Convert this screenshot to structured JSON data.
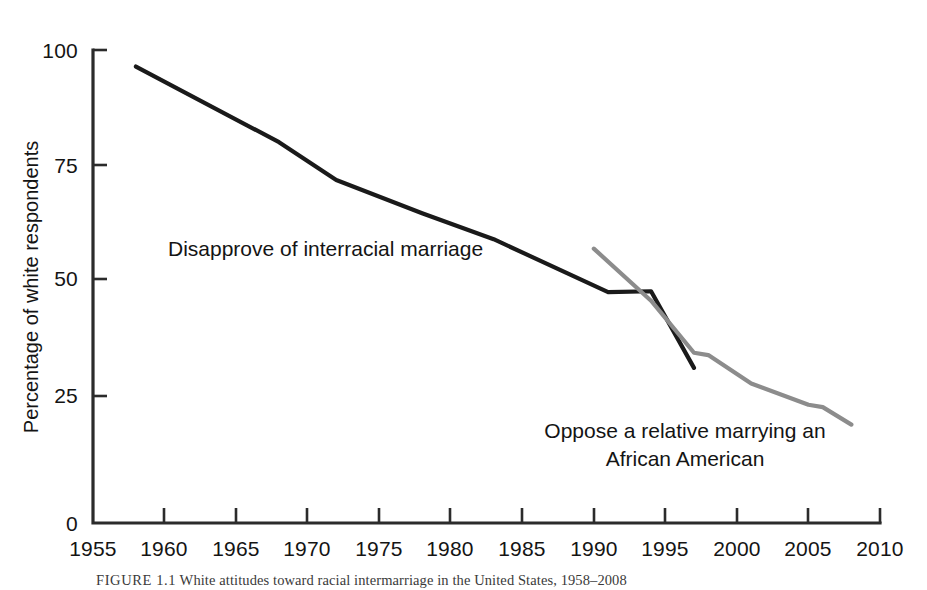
{
  "figure": {
    "caption_label": "FIGURE 1.1",
    "caption_text": "White attitudes toward racial intermarriage in the United States, 1958–2008"
  },
  "chart_data": {
    "type": "line",
    "title": "",
    "xlabel": "",
    "ylabel": "Percentage of white respondents",
    "xlim": [
      1955,
      2010
    ],
    "ylim": [
      0,
      100
    ],
    "xticks": [
      1955,
      1960,
      1965,
      1970,
      1975,
      1980,
      1985,
      1990,
      1995,
      2000,
      2005,
      2010
    ],
    "xtick_labels": [
      "1955",
      "1960",
      "1965",
      "1970",
      "1975",
      "1980",
      "1985",
      "1990",
      "1995",
      "2000",
      "2005",
      "2010"
    ],
    "yticks": [
      0,
      25,
      50,
      75,
      100
    ],
    "ytick_labels": [
      "0",
      "25",
      "50",
      "75",
      "100"
    ],
    "grid": false,
    "legend_position": "inline-annotations",
    "series": [
      {
        "name": "Disapprove of interracial marriage",
        "color": "#1a1a1a",
        "linewidth": 4.2,
        "x": [
          1958,
          1968,
          1972,
          1978,
          1983,
          1991,
          1994,
          1997
        ],
        "values": [
          96.5,
          80.5,
          72.5,
          65.5,
          60.0,
          48.8,
          49.0,
          32.8
        ]
      },
      {
        "name": "Oppose a relative marrying an African American",
        "color": "#8c8c8c",
        "linewidth": 4.2,
        "x": [
          1990,
          1994,
          1997,
          1998,
          2001,
          2005,
          2006,
          2008
        ],
        "values": [
          58.0,
          47.0,
          36.0,
          35.5,
          29.5,
          25.0,
          24.5,
          20.8
        ]
      }
    ],
    "annotations": [
      {
        "id": "annot-disapprove",
        "text": "Disapprove of interracial marriage",
        "lines": [
          "Disapprove of interracial marriage"
        ],
        "x_px": 168,
        "y_px": 256,
        "align": "start",
        "series_ref": "Disapprove of interracial marriage"
      },
      {
        "id": "annot-oppose",
        "text": "Oppose a relative marrying an African American",
        "lines": [
          "Oppose a relative marrying an",
          "African American"
        ],
        "x_px": 685,
        "y_px": 438,
        "align": "middle",
        "series_ref": "Oppose a relative marrying an African American"
      }
    ]
  },
  "axes": {
    "y_axis_title": "Percentage of white respondents",
    "y_tick_0": "0",
    "y_tick_25": "25",
    "y_tick_50": "50",
    "y_tick_75": "75",
    "y_tick_100": "100",
    "x_tick_1955": "1955",
    "x_tick_1960": "1960",
    "x_tick_1965": "1965",
    "x_tick_1970": "1970",
    "x_tick_1975": "1975",
    "x_tick_1980": "1980",
    "x_tick_1985": "1985",
    "x_tick_1990": "1990",
    "x_tick_1995": "1995",
    "x_tick_2000": "2000",
    "x_tick_2005": "2005",
    "x_tick_2010": "2010"
  },
  "annotation_labels": {
    "disapprove": "Disapprove of interracial marriage",
    "oppose_line1": "Oppose a relative marrying an",
    "oppose_line2": "African American"
  },
  "colors": {
    "series_black": "#1a1a1a",
    "series_gray": "#8c8c8c",
    "axis": "#2b2b2b",
    "background": "#ffffff",
    "text": "#141414"
  }
}
